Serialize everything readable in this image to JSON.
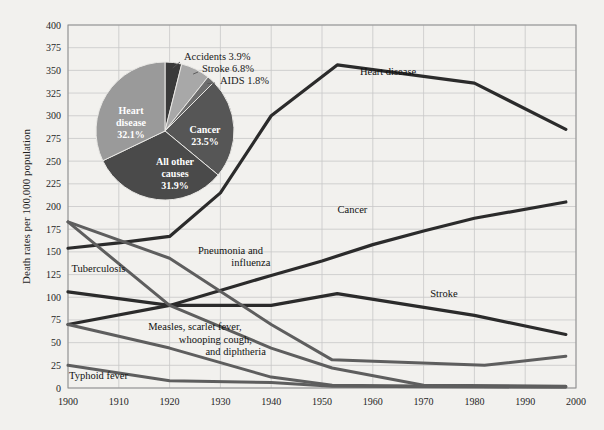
{
  "chart_data": {
    "type": "line",
    "title": "",
    "xlabel": "",
    "ylabel": "Death rates per 100,000 population",
    "xlim": [
      1900,
      2000
    ],
    "ylim": [
      0,
      400
    ],
    "yticks": [
      0,
      25,
      50,
      75,
      100,
      125,
      150,
      175,
      200,
      225,
      250,
      275,
      300,
      325,
      350,
      375,
      400
    ],
    "xticks": [
      1900,
      1910,
      1920,
      1930,
      1940,
      1950,
      1960,
      1970,
      1980,
      1990,
      2000
    ],
    "grid": true,
    "legend": "inline-labels",
    "series": [
      {
        "name": "Heart disease",
        "color": "#2b2b2b",
        "width": 3.2,
        "label_x": 1963,
        "label_y": 348,
        "points": [
          [
            1900,
            154
          ],
          [
            1910,
            160
          ],
          [
            1920,
            167
          ],
          [
            1930,
            215
          ],
          [
            1940,
            300
          ],
          [
            1953,
            356
          ],
          [
            1980,
            336
          ],
          [
            1998,
            285
          ]
        ]
      },
      {
        "name": "Cancer",
        "color": "#2b2b2b",
        "width": 3.2,
        "label_x": 1955,
        "label_y": 196,
        "points": [
          [
            1900,
            70
          ],
          [
            1920,
            91
          ],
          [
            1940,
            124
          ],
          [
            1950,
            140
          ],
          [
            1960,
            158
          ],
          [
            1970,
            173
          ],
          [
            1980,
            187
          ],
          [
            1998,
            205
          ]
        ]
      },
      {
        "name": "Stroke",
        "color": "#2b2b2b",
        "width": 3.2,
        "label_x": 1973,
        "label_y": 103,
        "points": [
          [
            1900,
            106
          ],
          [
            1920,
            91
          ],
          [
            1940,
            91
          ],
          [
            1953,
            104
          ],
          [
            1980,
            80
          ],
          [
            1998,
            59
          ]
        ]
      },
      {
        "name": "Pneumonia and influenza",
        "color": "#5e5e5e",
        "width": 3.0,
        "label_x": 1929,
        "label_y": 147,
        "label_line2": "influenza",
        "points": [
          [
            1900,
            183
          ],
          [
            1920,
            143
          ],
          [
            1940,
            70
          ],
          [
            1952,
            31
          ],
          [
            1982,
            25
          ],
          [
            1998,
            35
          ]
        ]
      },
      {
        "name": "Tuberculosis",
        "color": "#5e5e5e",
        "width": 3.0,
        "label_x": 1905,
        "label_y": 131,
        "points": [
          [
            1900,
            183
          ],
          [
            1920,
            91
          ],
          [
            1940,
            44
          ],
          [
            1952,
            22
          ],
          [
            1970,
            3
          ],
          [
            1998,
            2
          ]
        ]
      },
      {
        "name": "Measles, scarlet fever, whooping cough, and diphtheria",
        "color": "#5e5e5e",
        "width": 3.0,
        "label_x": 1922,
        "label_y": 66,
        "points": [
          [
            1900,
            70
          ],
          [
            1920,
            44
          ],
          [
            1940,
            12
          ],
          [
            1952,
            3
          ],
          [
            1998,
            1
          ]
        ]
      },
      {
        "name": "Typhoid fever",
        "color": "#5e5e5e",
        "width": 3.0,
        "label_x": 1904,
        "label_y": 12,
        "points": [
          [
            1900,
            25
          ],
          [
            1920,
            8
          ],
          [
            1940,
            6
          ],
          [
            1952,
            2
          ],
          [
            1998,
            1
          ]
        ]
      }
    ],
    "pie": {
      "title": "",
      "center_x": 165,
      "center_y": 131,
      "radius": 69,
      "start_angle": -90,
      "slices": [
        {
          "label": "Accidents",
          "value": 3.9,
          "percent_text": "Accidents 3.9%",
          "color": "#3a3a3a",
          "placement": "outside"
        },
        {
          "label": "Stroke",
          "value": 6.8,
          "percent_text": "Stroke 6.8%",
          "color": "#a8a8a8",
          "placement": "outside"
        },
        {
          "label": "AIDS",
          "value": 1.8,
          "percent_text": "AIDS 1.8%",
          "color": "#6e6e6e",
          "placement": "outside"
        },
        {
          "label": "Cancer",
          "value": 23.5,
          "percent_text": "Cancer\n23.5%",
          "color": "#565656",
          "placement": "inside",
          "line1": "Cancer",
          "line2": "23.5%"
        },
        {
          "label": "All other causes",
          "value": 31.9,
          "percent_text": "All other causes 31.9%",
          "color": "#4a4a4a",
          "placement": "inside",
          "line1": "All other",
          "line2": "causes",
          "line3": "31.9%"
        },
        {
          "label": "Heart disease",
          "value": 32.1,
          "percent_text": "Heart disease 32.1%",
          "color": "#9a9a9a",
          "placement": "inside",
          "line1": "Heart",
          "line2": "disease",
          "line3": "32.1%"
        }
      ]
    }
  },
  "labels": {
    "y_axis_title": "Death rates per 100,000 population",
    "heart_disease": "Heart disease",
    "cancer": "Cancer",
    "stroke": "Stroke",
    "pneumonia_l1": "Pneumonia and",
    "pneumonia_l2": "influenza",
    "tuberculosis": "Tuberculosis",
    "measles_l1": "Measles, scarlet fever,",
    "measles_l2": "whooping cough,",
    "measles_l3": "and diphtheria",
    "typhoid": "Typhoid fever",
    "pie_accidents": "Accidents 3.9%",
    "pie_stroke": "Stroke 6.8%",
    "pie_aids": "AIDS 1.8%",
    "pie_cancer_l1": "Cancer",
    "pie_cancer_l2": "23.5%",
    "pie_allother_l1": "All other",
    "pie_allother_l2": "causes",
    "pie_allother_l3": "31.9%",
    "pie_heart_l1": "Heart",
    "pie_heart_l2": "disease",
    "pie_heart_l3": "32.1%"
  }
}
